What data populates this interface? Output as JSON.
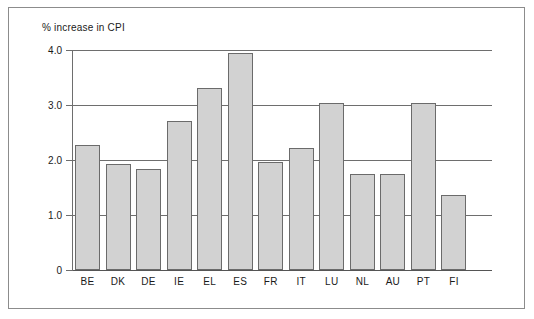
{
  "chart_data": {
    "type": "bar",
    "title": "% increase in CPI",
    "xlabel": "",
    "ylabel": "% increase in CPI",
    "ylim": [
      0,
      4.0
    ],
    "ytick_labels": [
      "0",
      "1.0",
      "2.0",
      "3.0",
      "4.0"
    ],
    "ytick_values": [
      0,
      1.0,
      2.0,
      3.0,
      4.0
    ],
    "grid": true,
    "legend": null,
    "categories": [
      "BE",
      "DK",
      "DE",
      "IE",
      "EL",
      "ES",
      "FR",
      "IT",
      "LU",
      "NL",
      "AU",
      "PT",
      "FI"
    ],
    "values": [
      2.27,
      1.93,
      1.83,
      2.71,
      3.31,
      3.94,
      1.96,
      2.21,
      3.04,
      1.74,
      1.74,
      3.04,
      1.36
    ],
    "bar_color": "#d2d2d2",
    "bar_edge_color": "#6b6b6b",
    "axis_color": "#6e6e6e",
    "frame_color": "#8c8c8c",
    "background_color": "#ffffff"
  }
}
